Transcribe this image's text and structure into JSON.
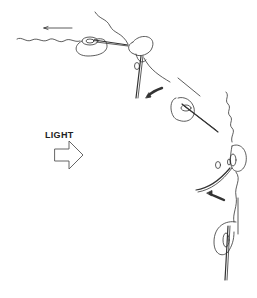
{
  "diagram": {
    "label": "LIGHT",
    "light_arrow_icon": "hollow-right-arrow",
    "colors": {
      "stroke": "#333333",
      "background": "#ffffff",
      "label": "#222222"
    },
    "stages": [
      {
        "name": "stage-1",
        "motion": "left"
      },
      {
        "name": "stage-2",
        "motion": "down-left-curve"
      },
      {
        "name": "stage-3",
        "motion": "up-left"
      },
      {
        "name": "stage-4",
        "motion": "left-curve"
      },
      {
        "name": "stage-5",
        "motion": "up"
      }
    ]
  }
}
